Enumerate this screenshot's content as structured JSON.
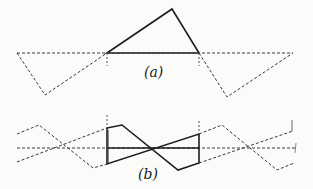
{
  "figure": {
    "panels": [
      {
        "id": "a",
        "label": "(a)",
        "description": "Solid triangle above a dashed baseline with dashed reflected triangles on both sides"
      },
      {
        "id": "b",
        "label": "(b)",
        "description": "Solid crossed quadrilateral (bow-tie) on a dashed center line with dashed zig-zag continuations on both sides"
      }
    ],
    "colors": {
      "solid": "#1e1e1e",
      "dashed": "#3a3a3a",
      "background": "#fbfbfa"
    }
  }
}
